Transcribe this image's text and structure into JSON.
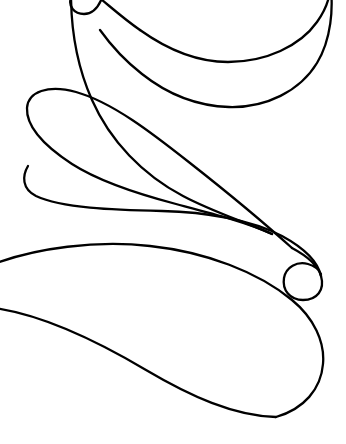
{
  "document": {
    "title": "Continuous line flourish",
    "kind": "line-art-drawing",
    "width": 346,
    "height": 444
  },
  "canvas": {
    "background_color": "#ffffff",
    "stroke_color": "#000000",
    "stroke_width": 2.3,
    "fill": "none"
  },
  "drawing": {
    "description": "A single continuous calligraphic flourish composed of three stacked teardrop lobes joined by long sweeping diagonals, with a tight spiral curl at the right middle and a small hook crossing the top edge.",
    "element_count": 1,
    "strokes": [
      {
        "name": "main-flourish",
        "closed": false,
        "path": "M 100 -6 C 92 14 78 18 70 6 C 64 -4 70 -14 82 -12 C 96 -10 108 2 128 20 C 158 48 196 68 232 66 C 268 64 300 46 318 22 C 330 6 332 -8 330 -20 M 72 -10 C 72 22 78 66 96 106 C 118 156 160 196 214 214 C 258 229 300 244 314 262 C 324 275 320 288 306 290 C 292 292 282 281 284 269 C 286 256 298 250 312 253 C 322 255 328 261 330 268",
        "segments": [
          {
            "name": "top-hook",
            "note": "small curl entering from the top edge near x=100, curving left and down to x=70"
          },
          {
            "name": "top-lobe-upper-edge",
            "note": "sweeps right and slightly down from x=70 across to the right edge"
          },
          {
            "name": "top-lobe-right-bulge",
            "note": "rounded right end of the top teardrop reaching x=328 around y=60"
          },
          {
            "name": "upper-diagonal",
            "note": "long diagonal descending left-to-right from the top-left entry toward the middle"
          },
          {
            "name": "middle-lobe-left-tip",
            "note": "rounded left end of the middle teardrop at about x=27, y=100 to y=215"
          },
          {
            "name": "middle-lobe-lower-edge",
            "note": "long nearly-horizontal run from the left tip rightward to the spiral"
          },
          {
            "name": "spiral-curl",
            "note": "tight inward spiral centred near x=300, y=272 with outer radius about 22"
          },
          {
            "name": "lower-diagonal",
            "note": "long diagonal from the spiral down-left across to the left edge"
          },
          {
            "name": "bottom-lobe",
            "note": "large teardrop occupying the lower third, bottoming near y=418 and reaching x=325"
          }
        ]
      }
    ],
    "edge_crossings": [
      {
        "edge": "top",
        "approx_x": 72,
        "approx_y": 0
      },
      {
        "edge": "top",
        "approx_x": 100,
        "approx_y": 0
      },
      {
        "edge": "top",
        "approx_x": 330,
        "approx_y": 0
      },
      {
        "edge": "left",
        "approx_x": 0,
        "approx_y": 262
      },
      {
        "edge": "left",
        "approx_x": 0,
        "approx_y": 307
      }
    ],
    "extrema": {
      "top_lobe_right_x": 328,
      "middle_lobe_left_x": 27,
      "bottom_lobe_right_x": 325,
      "bottom_lobe_bottom_y": 418,
      "spiral_center": [
        300,
        272
      ]
    }
  }
}
